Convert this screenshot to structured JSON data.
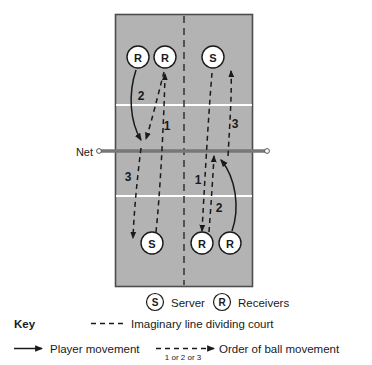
{
  "figure": {
    "court": {
      "fill_color": "#b3b3b3",
      "border_color": "#4d4d4d",
      "service_line_color": "#ffffff",
      "divider_label": "imaginary-centre-line"
    },
    "net": {
      "label": "Net",
      "color": "#666666"
    },
    "players": [
      {
        "id": "top-left-receiver",
        "letter": "R",
        "role": "Receivers",
        "half": "top",
        "x": 138,
        "y": 57
      },
      {
        "id": "top-inner-receiver",
        "letter": "R",
        "role": "Receivers",
        "half": "top",
        "x": 165,
        "y": 57
      },
      {
        "id": "top-server",
        "letter": "S",
        "role": "Server",
        "half": "top",
        "x": 213,
        "y": 57
      },
      {
        "id": "bottom-server",
        "letter": "S",
        "role": "Server",
        "half": "bottom",
        "x": 152,
        "y": 243
      },
      {
        "id": "bottom-inner-receiver",
        "letter": "R",
        "role": "Receivers",
        "half": "bottom",
        "x": 202,
        "y": 243
      },
      {
        "id": "bottom-right-receiver",
        "letter": "R",
        "role": "Receivers",
        "half": "bottom",
        "x": 230,
        "y": 243
      }
    ],
    "order_labels": [
      {
        "id": "order-top-left-2",
        "value": "2",
        "x": 141,
        "y": 96
      },
      {
        "id": "order-top-mid-1",
        "value": "1",
        "x": 167,
        "y": 126
      },
      {
        "id": "order-top-right-3",
        "value": "3",
        "x": 235,
        "y": 124
      },
      {
        "id": "order-bottom-left-3",
        "value": "3",
        "x": 128,
        "y": 177
      },
      {
        "id": "order-bottom-mid-1",
        "value": "1",
        "x": 198,
        "y": 180
      },
      {
        "id": "order-bottom-right-2",
        "value": "2",
        "x": 219,
        "y": 208
      }
    ]
  },
  "legend": {
    "key_label": "Key",
    "role_items": [
      {
        "symbol": "S",
        "label": "Server"
      },
      {
        "symbol": "R",
        "label": "Receivers"
      }
    ],
    "imaginary_line_label": "Imaginary line dividing court",
    "player_movement_label": "Player movement",
    "ball_movement_label": "Order of ball movement",
    "ball_order_caption": "1 or 2 or 3"
  }
}
